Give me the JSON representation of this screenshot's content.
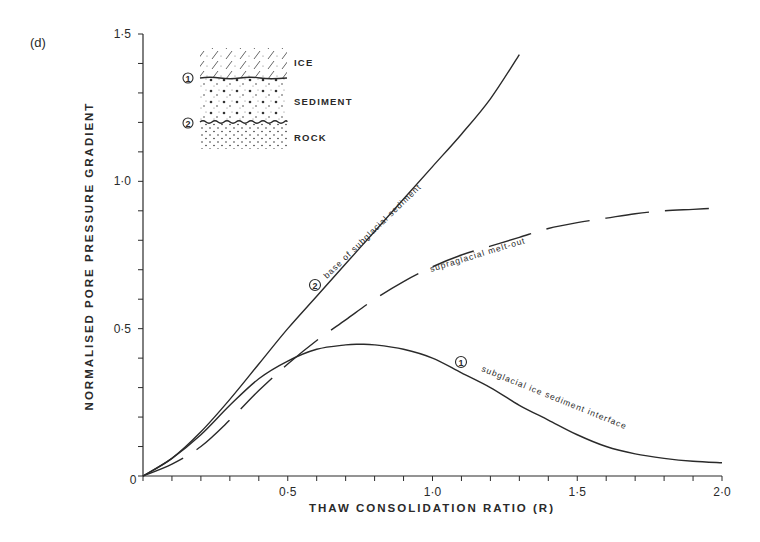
{
  "panel_label": "(d)",
  "chart_data": {
    "type": "line",
    "title": "",
    "xlabel": "THAW CONSOLIDATION RATIO (R)",
    "ylabel": "NORMALISED PORE PRESSURE GRADIENT",
    "xlim": [
      0,
      2.0
    ],
    "ylim": [
      0,
      1.5
    ],
    "x_ticks": [
      "0",
      "0·5",
      "1·0",
      "1·5",
      "2·0"
    ],
    "x_tick_values": [
      0,
      0.5,
      1.0,
      1.5,
      2.0
    ],
    "x_minor_step": 0.1,
    "y_ticks": [
      "0",
      "0·5",
      "1·0",
      "1·5"
    ],
    "y_tick_values": [
      0,
      0.5,
      1.0,
      1.5
    ],
    "y_minor_step": 0.1,
    "grid": false,
    "legend": "none (curves labelled inline)",
    "series": [
      {
        "name": "base of subglacial sediment",
        "marker": "2",
        "style": "solid",
        "x": [
          0,
          0.1,
          0.2,
          0.3,
          0.4,
          0.5,
          0.6,
          0.7,
          0.8,
          0.9,
          1.0,
          1.1,
          1.2,
          1.3
        ],
        "values": [
          0,
          0.06,
          0.15,
          0.26,
          0.38,
          0.5,
          0.61,
          0.72,
          0.83,
          0.94,
          1.05,
          1.16,
          1.28,
          1.43
        ]
      },
      {
        "name": "subglacial ice sediment interface",
        "marker": "1",
        "style": "solid",
        "x": [
          0,
          0.1,
          0.2,
          0.3,
          0.4,
          0.5,
          0.6,
          0.7,
          0.75,
          0.8,
          0.9,
          1.0,
          1.1,
          1.2,
          1.3,
          1.4,
          1.5,
          1.6,
          1.7,
          1.8,
          1.9,
          2.0
        ],
        "values": [
          0,
          0.06,
          0.14,
          0.24,
          0.33,
          0.39,
          0.43,
          0.445,
          0.447,
          0.445,
          0.43,
          0.4,
          0.35,
          0.3,
          0.24,
          0.19,
          0.14,
          0.1,
          0.075,
          0.06,
          0.05,
          0.045
        ]
      },
      {
        "name": "supraglacial melt-out",
        "marker": "",
        "style": "dashed",
        "x": [
          0,
          0.1,
          0.2,
          0.3,
          0.4,
          0.5,
          0.6,
          0.7,
          0.8,
          0.9,
          1.0,
          1.1,
          1.2,
          1.3,
          1.4,
          1.5,
          1.6,
          1.7,
          1.8,
          1.9,
          2.0
        ],
        "values": [
          0,
          0.04,
          0.1,
          0.19,
          0.29,
          0.38,
          0.46,
          0.53,
          0.6,
          0.66,
          0.71,
          0.75,
          0.78,
          0.81,
          0.84,
          0.86,
          0.875,
          0.89,
          0.9,
          0.905,
          0.91
        ]
      }
    ],
    "annotations": [
      "base of subglacial sediment",
      "supraglacial melt-out",
      "subglacial ice sediment interface"
    ]
  },
  "inset": {
    "layers": [
      "ICE",
      "SEDIMENT",
      "ROCK"
    ],
    "markers": [
      "1",
      "2"
    ]
  },
  "labels": {
    "curve2_marker": "2",
    "curve1_marker": "1",
    "curve2_text": "base of subglacial sediment",
    "curve1_text": "subglacial ice sediment interface",
    "curve3_text": "supraglacial melt-out"
  }
}
